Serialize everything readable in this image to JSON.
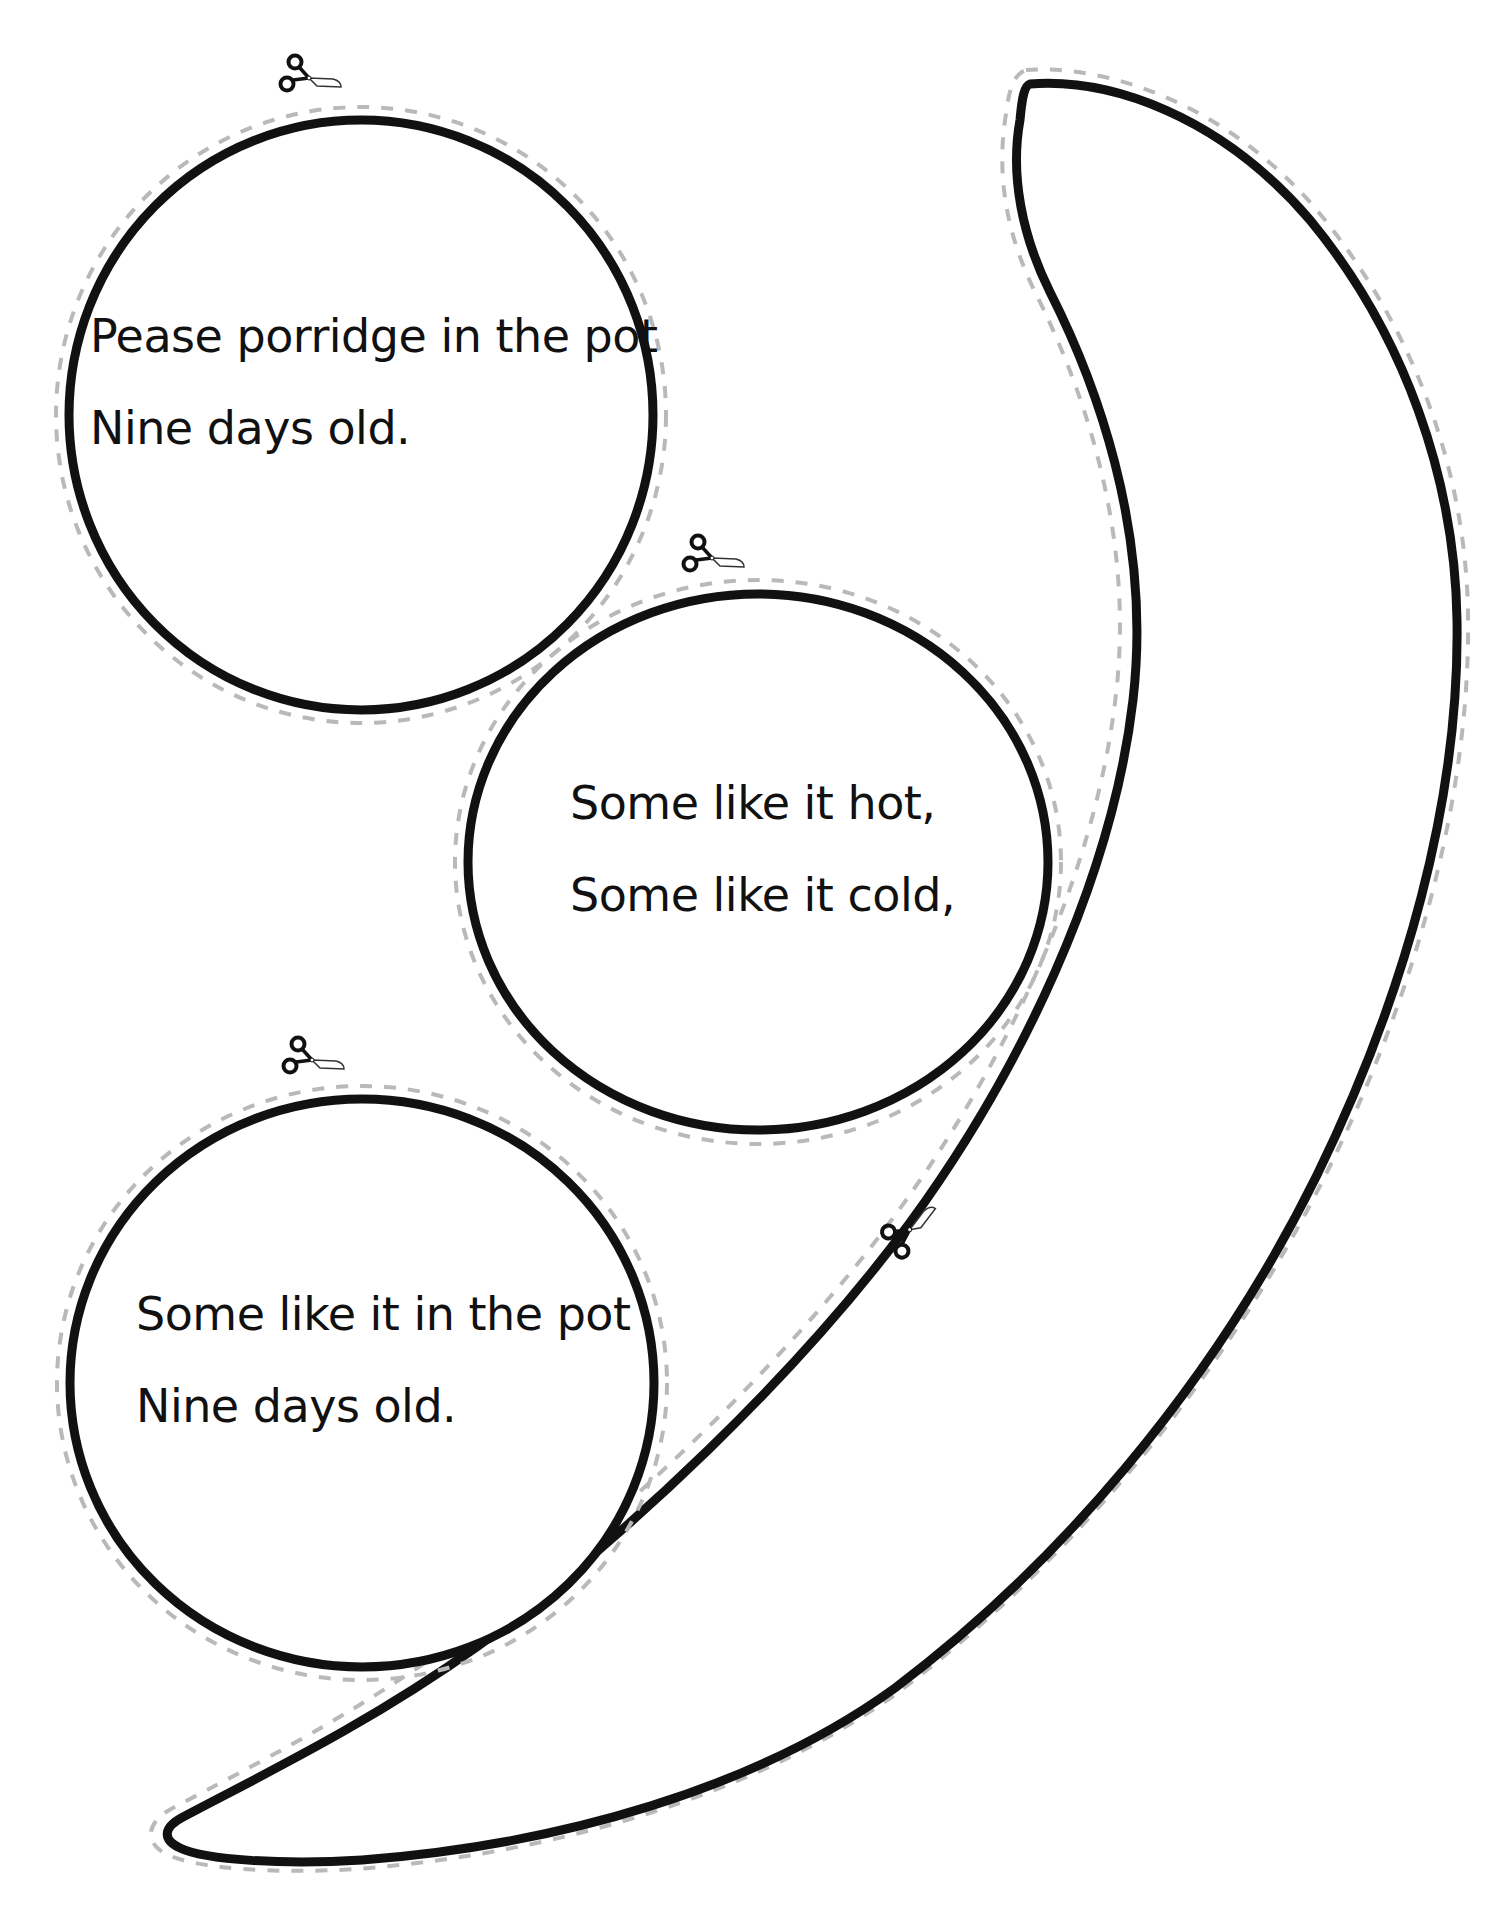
{
  "colors": {
    "outline": "#111111",
    "cut_line": "#b9b9b9",
    "background": "#ffffff"
  },
  "pieces": [
    {
      "id": "circle-1",
      "shape": "circle",
      "lines": [
        "Pease porridge in the pot",
        "Nine days old."
      ]
    },
    {
      "id": "circle-2",
      "shape": "circle",
      "lines": [
        "Some like it hot,",
        "Some like it cold,"
      ]
    },
    {
      "id": "circle-3",
      "shape": "circle",
      "lines": [
        "Some like it in the pot",
        "Nine days old."
      ]
    },
    {
      "id": "crescent",
      "shape": "crescent-spoon",
      "lines": []
    }
  ],
  "icons": {
    "scissors": "scissors-icon",
    "cut_line": "dashed-cut-line"
  }
}
